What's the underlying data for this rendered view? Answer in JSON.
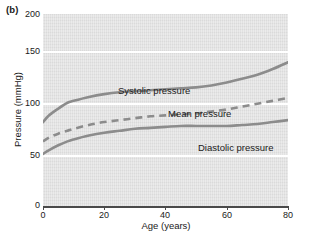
{
  "figure": {
    "panel_label": "(b)"
  },
  "chart_data": {
    "type": "line",
    "title": "",
    "xlabel": "Age (years)",
    "ylabel": "Pressure (mmHg)",
    "xlim": [
      0,
      80
    ],
    "ylim": [
      0,
      200
    ],
    "xticks": [
      0,
      20,
      40,
      60,
      80
    ],
    "xtick_labels": [
      "0",
      "20",
      "40",
      "60",
      "80"
    ],
    "yticks": [
      0,
      50,
      100,
      150,
      200
    ],
    "ytick_labels": [
      "0",
      "50",
      "100",
      "150",
      "200"
    ],
    "grid": "horizontal-white-at-50-100-150",
    "legend": "inline-annotations",
    "plot_background": "#e2e2e2",
    "line_color": "#8c8c8c",
    "axis_color": "#4a4a4a",
    "series": [
      {
        "name": "Systolic pressure",
        "label": "Systolic pressure",
        "style": "solid",
        "x": [
          0,
          2,
          5,
          8,
          10,
          15,
          20,
          25,
          30,
          35,
          40,
          45,
          50,
          55,
          60,
          65,
          70,
          75,
          80
        ],
        "values": [
          88,
          95,
          102,
          108,
          110,
          114,
          117,
          119,
          120,
          121,
          122,
          123,
          124,
          126,
          129,
          133,
          137,
          143,
          150
        ]
      },
      {
        "name": "Mean pressure",
        "label": "Mean pressure",
        "style": "dashed",
        "x": [
          0,
          2,
          5,
          8,
          10,
          15,
          20,
          25,
          30,
          35,
          40,
          45,
          50,
          55,
          60,
          65,
          70,
          75,
          80
        ],
        "values": [
          68,
          72,
          76,
          79,
          81,
          85,
          88,
          90,
          92,
          94,
          95,
          96,
          97,
          99,
          101,
          104,
          107,
          110,
          113
        ]
      },
      {
        "name": "Diastolic pressure",
        "label": "Diastolic pressure",
        "style": "solid",
        "x": [
          0,
          2,
          5,
          8,
          10,
          15,
          20,
          25,
          30,
          35,
          40,
          45,
          50,
          55,
          60,
          65,
          70,
          75,
          80
        ],
        "values": [
          55,
          59,
          64,
          68,
          70,
          74,
          77,
          79,
          81,
          82,
          83,
          84,
          84,
          84,
          84,
          85,
          86,
          88,
          90
        ]
      }
    ]
  }
}
